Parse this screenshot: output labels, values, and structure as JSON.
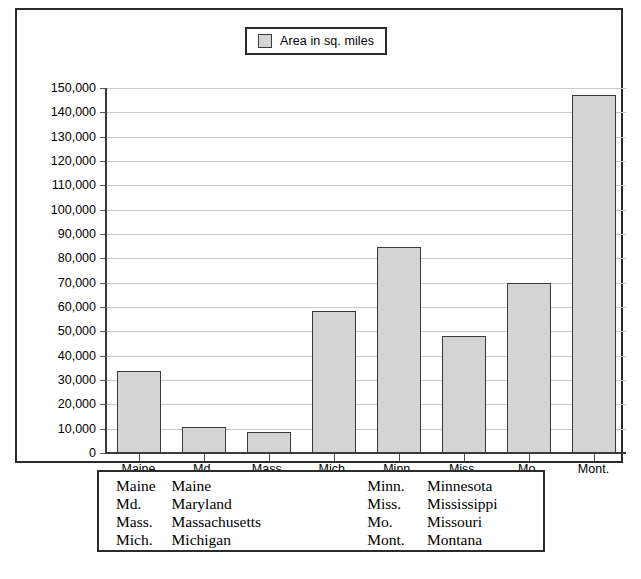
{
  "legend": {
    "swatch_color": "#d4d4d4",
    "label": "Area in sq. miles"
  },
  "chart_data": {
    "type": "bar",
    "title": "",
    "xlabel": "",
    "ylabel": "",
    "ylim": [
      0,
      150000
    ],
    "grid": true,
    "legend_position": "top-center",
    "series_name": "Area in sq. miles",
    "categories": [
      "Maine",
      "Md.",
      "Mass.",
      "Mich.",
      "Minn.",
      "Miss.",
      "Mo.",
      "Mont."
    ],
    "values": [
      33700,
      10500,
      8500,
      58500,
      84500,
      48000,
      70000,
      147000
    ],
    "y_ticks": [
      "0",
      "10,000",
      "20,000",
      "30,000",
      "40,000",
      "50,000",
      "60,000",
      "70,000",
      "80,000",
      "90,000",
      "100,000",
      "110,000",
      "120,000",
      "130,000",
      "140,000",
      "150,000"
    ],
    "y_tick_values": [
      0,
      10000,
      20000,
      30000,
      40000,
      50000,
      60000,
      70000,
      80000,
      90000,
      100000,
      110000,
      120000,
      130000,
      140000,
      150000
    ],
    "bar_fill": "#d4d4d4",
    "bar_stroke": "#3a3a3a"
  },
  "key": {
    "rows": [
      {
        "abbr_left": "Maine",
        "full_left": "Maine",
        "abbr_right": "Minn.",
        "full_right": "Minnesota"
      },
      {
        "abbr_left": "Md.",
        "full_left": "Maryland",
        "abbr_right": "Miss.",
        "full_right": "Mississippi"
      },
      {
        "abbr_left": "Mass.",
        "full_left": "Massachusetts",
        "abbr_right": "Mo.",
        "full_right": "Missouri"
      },
      {
        "abbr_left": "Mich.",
        "full_left": "Michigan",
        "abbr_right": "Mont.",
        "full_right": "Montana"
      }
    ]
  }
}
